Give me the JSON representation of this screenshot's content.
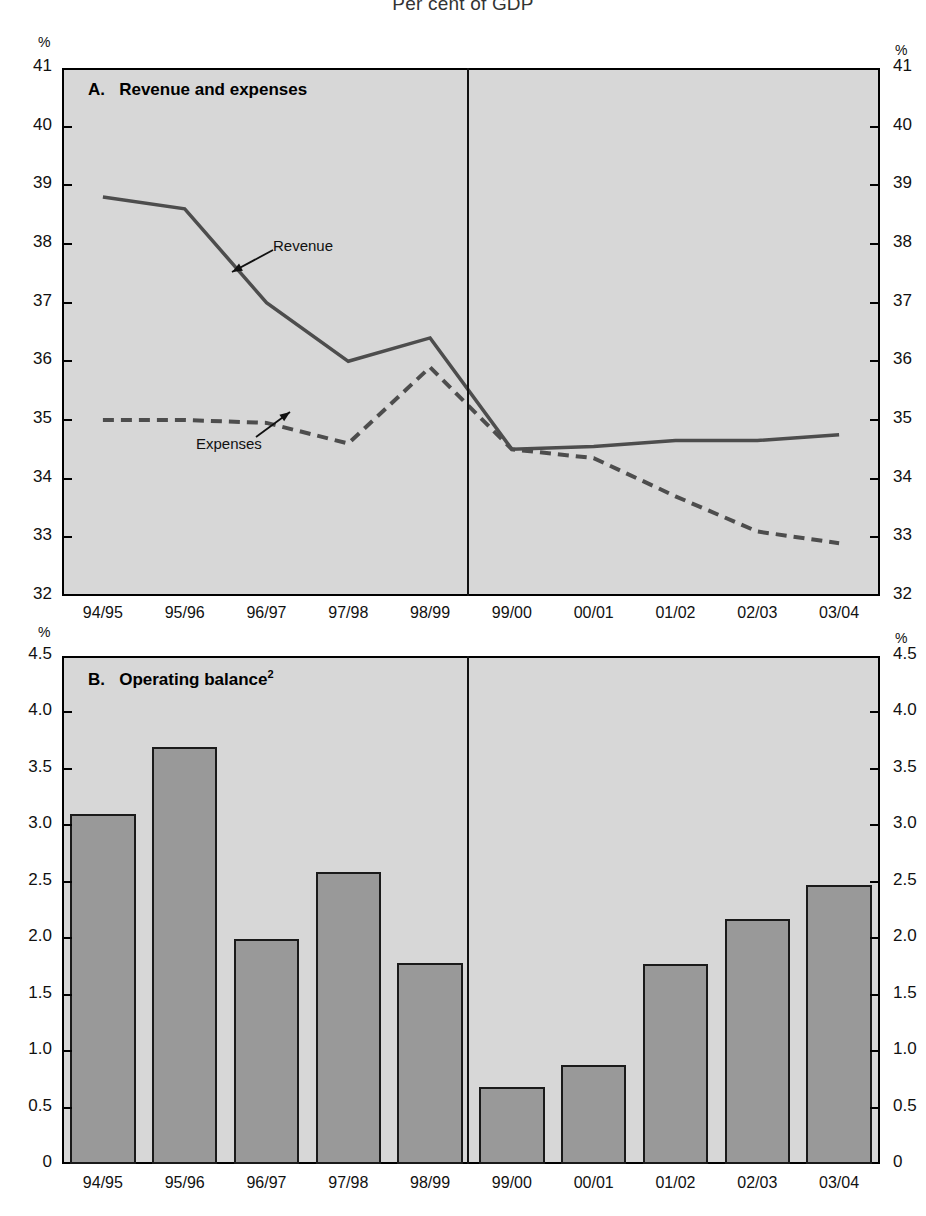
{
  "figure": {
    "title": "Per cent of GDP"
  },
  "panel_a": {
    "label_prefix": "A.",
    "label": "Revenue and expenses",
    "axis_unit": "%",
    "series_labels": {
      "revenue": "Revenue",
      "expenses": "Expenses"
    }
  },
  "panel_b": {
    "label_prefix": "B.",
    "label": "Operating balance",
    "label_sup": "2",
    "axis_unit": "%"
  },
  "colors": {
    "plot_background": "#d7d7d7",
    "bar_fill": "#999999",
    "line": "#4d4d4d",
    "axis": "#000000"
  },
  "chart_data": [
    {
      "type": "line",
      "title": "A.  Revenue and expenses",
      "subtitle": "Per cent of GDP",
      "xlabel": "",
      "ylabel": "%",
      "ylim": [
        32,
        41
      ],
      "yticks": [
        32,
        33,
        34,
        35,
        36,
        37,
        38,
        39,
        40,
        41
      ],
      "ytick_labels": [
        "32",
        "33",
        "34",
        "35",
        "36",
        "37",
        "38",
        "39",
        "40",
        "41"
      ],
      "categories": [
        "94/95",
        "95/96",
        "96/97",
        "97/98",
        "98/99",
        "99/00",
        "00/01",
        "01/02",
        "02/03",
        "03/04"
      ],
      "grid": false,
      "legend": "annotated-inline",
      "annotations": [
        {
          "text": "Revenue",
          "points_to": "revenue-series"
        },
        {
          "text": "Expenses",
          "points_to": "expenses-series"
        }
      ],
      "forecast_divider_after": "98/99",
      "series": [
        {
          "name": "Revenue",
          "style": "solid",
          "values": [
            38.8,
            38.6,
            37.0,
            36.0,
            36.4,
            34.5,
            34.55,
            34.65,
            34.65,
            34.75
          ]
        },
        {
          "name": "Expenses",
          "style": "dashed",
          "values": [
            35.0,
            35.0,
            34.95,
            34.6,
            35.9,
            34.5,
            34.35,
            33.7,
            33.1,
            32.9
          ]
        }
      ]
    },
    {
      "type": "bar",
      "title": "B.  Operating balance",
      "xlabel": "",
      "ylabel": "%",
      "ylim": [
        0,
        4.5
      ],
      "yticks": [
        0,
        0.5,
        1.0,
        1.5,
        2.0,
        2.5,
        3.0,
        3.5,
        4.0,
        4.5
      ],
      "ytick_labels": [
        "0",
        "0.5",
        "1.0",
        "1.5",
        "2.0",
        "2.5",
        "3.0",
        "3.5",
        "4.0",
        "4.5"
      ],
      "categories": [
        "94/95",
        "95/96",
        "96/97",
        "97/98",
        "98/99",
        "99/00",
        "00/01",
        "01/02",
        "02/03",
        "03/04"
      ],
      "values": [
        3.1,
        3.69,
        1.99,
        2.59,
        1.78,
        0.68,
        0.88,
        1.77,
        2.17,
        2.47
      ],
      "grid": false,
      "legend": "none",
      "forecast_divider_after": "98/99"
    }
  ]
}
